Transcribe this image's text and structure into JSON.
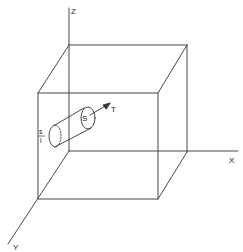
{
  "diagram": {
    "type": "3d-box-with-cylinder",
    "axes": {
      "z_label": "Z",
      "x_label": "X",
      "y_label": "Y"
    },
    "cylinder": {
      "end_face_label": "S",
      "direction_label": "T",
      "side_label_top": "s",
      "side_label_bottom": "l"
    },
    "colors": {
      "stroke": "#333333",
      "background": "#ffffff"
    }
  }
}
